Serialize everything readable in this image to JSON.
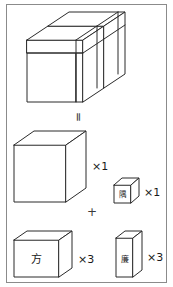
{
  "figure": {
    "title_visible": false,
    "border": {
      "present": true,
      "color": "#8b8b8b"
    },
    "ink_color": "#2b2b2b",
    "background": "#ffffff"
  },
  "operators": {
    "equals": "=",
    "plus": "+"
  },
  "assembled_solid": {
    "name": "dissected-large-cube",
    "description_visible": false
  },
  "parts": [
    {
      "id": "big-cube",
      "label": "",
      "multiplier": "×1",
      "shape": "cube"
    },
    {
      "id": "corner-cube",
      "label": "隅",
      "multiplier": "×1",
      "shape": "small-cube"
    },
    {
      "id": "square-slab",
      "label": "方",
      "multiplier": "×3",
      "shape": "flat-slab"
    },
    {
      "id": "bar-prism",
      "label": "廉",
      "multiplier": "×3",
      "shape": "tall-bar"
    }
  ]
}
